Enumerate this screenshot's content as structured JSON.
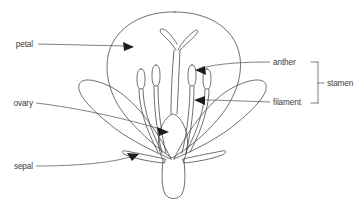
{
  "diagram": {
    "background_color": "#ffffff",
    "line_color": "#4a4a4a",
    "text_color": "#3a3a3a",
    "labels": {
      "petal": "petal",
      "ovary": "ovary",
      "sepal": "sepal",
      "anther": "anther",
      "filament": "filament",
      "stamen": "stamen"
    },
    "parts": [
      {
        "name": "petal",
        "side": "left",
        "label": "petal"
      },
      {
        "name": "ovary",
        "side": "left",
        "label": "ovary"
      },
      {
        "name": "sepal",
        "side": "left",
        "label": "sepal"
      },
      {
        "name": "anther",
        "side": "right",
        "label": "anther"
      },
      {
        "name": "filament",
        "side": "right",
        "label": "filament"
      },
      {
        "name": "stamen",
        "side": "right",
        "label": "stamen",
        "grouping": true
      }
    ],
    "grouping": {
      "bracket_label": "stamen",
      "members": [
        "anther",
        "filament"
      ]
    }
  }
}
